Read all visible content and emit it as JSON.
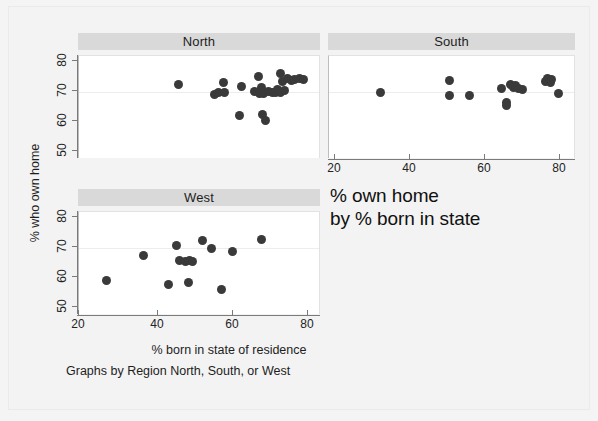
{
  "figure": {
    "y_axis_title": "% who own home",
    "x_axis_title": "% born in state of residence",
    "caption": "Graphs by Region North, South, or West",
    "note_line1": "% own home",
    "note_line2": "by % born in state",
    "marker_color": "#3a3a3a",
    "panel_header_color": "#d9d9d9",
    "background_color": "#f3f3f3"
  },
  "axes": {
    "y_ticks": [
      "80",
      "70",
      "60",
      "50"
    ],
    "x_ticks": [
      "20",
      "40",
      "60",
      "80"
    ]
  },
  "chart_data": {
    "type": "scatter",
    "xlabel": "% born in state of residence",
    "ylabel": "% who own home",
    "xlim": [
      16,
      85
    ],
    "ylim": [
      48,
      82
    ],
    "x_ticks": [
      20,
      40,
      60,
      80
    ],
    "y_ticks": [
      50,
      60,
      70,
      80
    ],
    "grid": false,
    "legend": "none",
    "panel_variable": "Region",
    "panels": [
      {
        "name": "North",
        "points": [
          {
            "x": 44.5,
            "y": 72.6
          },
          {
            "x": 55.0,
            "y": 69.3
          },
          {
            "x": 56.0,
            "y": 70.0
          },
          {
            "x": 57.5,
            "y": 73.3
          },
          {
            "x": 57.8,
            "y": 69.8
          },
          {
            "x": 62.8,
            "y": 71.8
          },
          {
            "x": 62.2,
            "y": 62.3
          },
          {
            "x": 67.5,
            "y": 75.3
          },
          {
            "x": 68.5,
            "y": 71.5
          },
          {
            "x": 68.0,
            "y": 69.6
          },
          {
            "x": 68.8,
            "y": 62.6
          },
          {
            "x": 69.5,
            "y": 60.4
          },
          {
            "x": 69.0,
            "y": 69.5
          },
          {
            "x": 70.5,
            "y": 70.3
          },
          {
            "x": 71.5,
            "y": 69.8
          },
          {
            "x": 72.5,
            "y": 70.0
          },
          {
            "x": 73.0,
            "y": 71.0
          },
          {
            "x": 74.0,
            "y": 76.3
          },
          {
            "x": 74.5,
            "y": 73.6
          },
          {
            "x": 75.2,
            "y": 70.6
          },
          {
            "x": 76.0,
            "y": 74.6
          },
          {
            "x": 77.0,
            "y": 73.8
          },
          {
            "x": 78.0,
            "y": 74.2
          },
          {
            "x": 79.5,
            "y": 74.5
          },
          {
            "x": 80.5,
            "y": 74.3
          },
          {
            "x": 66.5,
            "y": 70.2
          },
          {
            "x": 73.8,
            "y": 69.9
          }
        ]
      },
      {
        "name": "South",
        "points": [
          {
            "x": 30.5,
            "y": 69.9
          },
          {
            "x": 50.0,
            "y": 73.8
          },
          {
            "x": 50.0,
            "y": 69.0
          },
          {
            "x": 55.5,
            "y": 69.0
          },
          {
            "x": 64.5,
            "y": 71.3
          },
          {
            "x": 66.0,
            "y": 66.5
          },
          {
            "x": 66.0,
            "y": 65.4
          },
          {
            "x": 67.0,
            "y": 72.4
          },
          {
            "x": 68.0,
            "y": 71.5
          },
          {
            "x": 68.5,
            "y": 72.2
          },
          {
            "x": 69.5,
            "y": 71.1
          },
          {
            "x": 70.5,
            "y": 70.8
          },
          {
            "x": 77.0,
            "y": 73.6
          },
          {
            "x": 77.5,
            "y": 74.6
          },
          {
            "x": 78.3,
            "y": 73.2
          },
          {
            "x": 78.8,
            "y": 74.3
          },
          {
            "x": 80.5,
            "y": 69.4
          }
        ]
      },
      {
        "name": "West",
        "points": [
          {
            "x": 23.8,
            "y": 59.3
          },
          {
            "x": 34.5,
            "y": 67.6
          },
          {
            "x": 41.8,
            "y": 57.9
          },
          {
            "x": 44.0,
            "y": 70.8
          },
          {
            "x": 44.8,
            "y": 65.8
          },
          {
            "x": 46.5,
            "y": 65.6
          },
          {
            "x": 47.5,
            "y": 58.5
          },
          {
            "x": 47.8,
            "y": 65.8
          },
          {
            "x": 48.5,
            "y": 65.4
          },
          {
            "x": 51.5,
            "y": 72.4
          },
          {
            "x": 54.0,
            "y": 69.9
          },
          {
            "x": 57.0,
            "y": 56.1
          },
          {
            "x": 60.0,
            "y": 69.0
          },
          {
            "x": 68.5,
            "y": 72.7
          }
        ]
      }
    ]
  }
}
